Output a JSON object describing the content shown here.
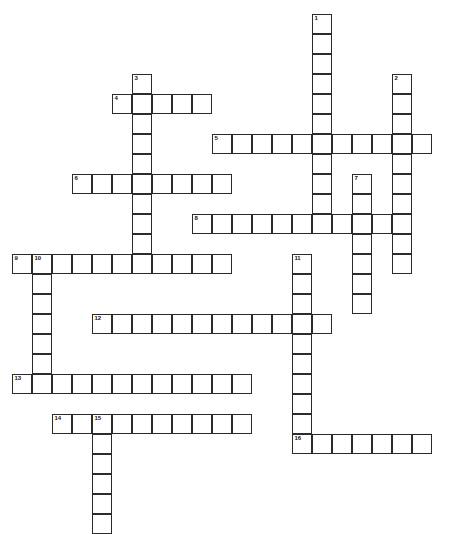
{
  "puzzle": {
    "title": "Crossword Puzzle Grid",
    "type": "crossword-grid",
    "cell_size_px": 20,
    "canvas": {
      "width": 449,
      "height": 489
    },
    "colors": {
      "background": "#ffffff",
      "cell_fill": "#ffffff",
      "cell_border": "#2b2b2b",
      "clue_number": "#111111"
    },
    "origin": {
      "x": 12,
      "y": 14
    },
    "entries": [
      {
        "number": "1",
        "direction": "down",
        "col": 15,
        "row": 0,
        "length": 10
      },
      {
        "number": "2",
        "direction": "down",
        "col": 19,
        "row": 3,
        "length": 10
      },
      {
        "number": "3",
        "direction": "down",
        "col": 6,
        "row": 3,
        "length": 9
      },
      {
        "number": "4",
        "direction": "across",
        "col": 5,
        "row": 4,
        "length": 5
      },
      {
        "number": "5",
        "direction": "across",
        "col": 10,
        "row": 6,
        "length": 11
      },
      {
        "number": "6",
        "direction": "across",
        "col": 3,
        "row": 8,
        "length": 8
      },
      {
        "number": "7",
        "direction": "down",
        "col": 17,
        "row": 8,
        "length": 7
      },
      {
        "number": "8",
        "direction": "across",
        "col": 9,
        "row": 10,
        "length": 10
      },
      {
        "number": "9",
        "direction": "across",
        "col": 0,
        "row": 12,
        "length": 11
      },
      {
        "number": "10",
        "direction": "down",
        "col": 1,
        "row": 12,
        "length": 7
      },
      {
        "number": "11",
        "direction": "down",
        "col": 14,
        "row": 12,
        "length": 9
      },
      {
        "number": "12",
        "direction": "across",
        "col": 4,
        "row": 15,
        "length": 12
      },
      {
        "number": "13",
        "direction": "across",
        "col": 0,
        "row": 18,
        "length": 12
      },
      {
        "number": "14",
        "direction": "across",
        "col": 2,
        "row": 20,
        "length": 10
      },
      {
        "number": "15",
        "direction": "down",
        "col": 4,
        "row": 20,
        "length": 6
      },
      {
        "number": "16",
        "direction": "across",
        "col": 14,
        "row": 21,
        "length": 7
      }
    ],
    "clue_labels": {
      "1": "1",
      "2": "2",
      "3": "3",
      "4": "4",
      "5": "5",
      "6": "6",
      "7": "7",
      "8": "8",
      "9": "9",
      "10": "10",
      "11": "11",
      "12": "12",
      "13": "13",
      "14": "14",
      "15": "15",
      "16": "16"
    }
  }
}
